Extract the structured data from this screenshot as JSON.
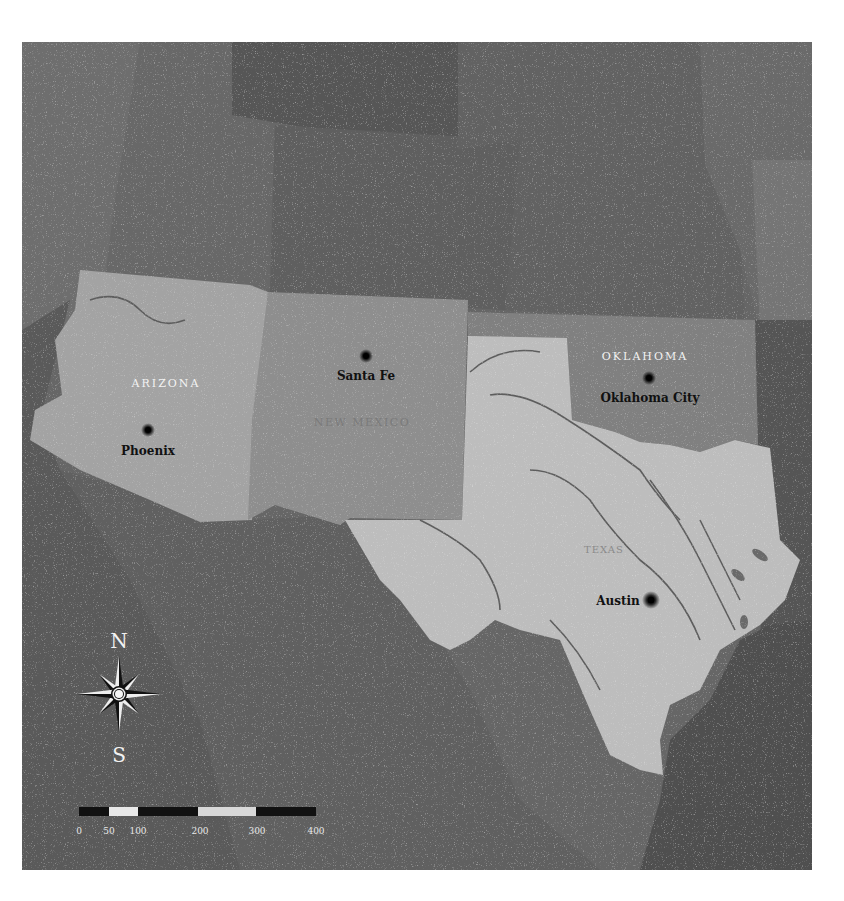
{
  "map": {
    "colors": {
      "background": "#ffffff",
      "frame": "#6a6a6a",
      "neighbor_dark": "#555555",
      "neighbor_mid": "#666666",
      "neighbor_light": "#707070",
      "arizona": "#a3a3a3",
      "new_mexico": "#8e8e8e",
      "oklahoma": "#7e7e7e",
      "texas": "#bdbdbd",
      "river": "#5a5a5a",
      "gulf": "#505050"
    },
    "states": [
      {
        "id": "arizona",
        "label": "ARIZONA",
        "style": "light"
      },
      {
        "id": "new_mexico",
        "label": "NEW MEXICO",
        "style": "faint"
      },
      {
        "id": "oklahoma",
        "label": "OKLAHOMA",
        "style": "light"
      },
      {
        "id": "texas",
        "label": "TEXAS",
        "style": "faint"
      }
    ],
    "capitals": [
      {
        "name": "Phoenix",
        "state": "arizona"
      },
      {
        "name": "Santa Fe",
        "state": "new_mexico"
      },
      {
        "name": "Oklahoma City",
        "state": "oklahoma"
      },
      {
        "name": "Austin",
        "state": "texas"
      }
    ],
    "compass": {
      "north": "N",
      "south": "S"
    },
    "scale_bar": {
      "ticks": [
        "0",
        "50",
        "100",
        "200",
        "300",
        "400"
      ]
    }
  }
}
